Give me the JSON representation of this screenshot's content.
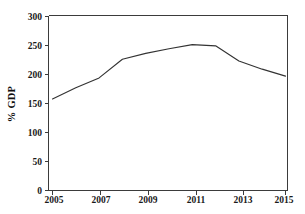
{
  "chart_data": {
    "type": "line",
    "title": "",
    "xlabel": "",
    "ylabel": "% GDP",
    "x": [
      2005,
      2006,
      2007,
      2008,
      2009,
      2010,
      2011,
      2012,
      2013,
      2014,
      2015
    ],
    "values": [
      157,
      176,
      193,
      225,
      235,
      243,
      250,
      248,
      222,
      208,
      196
    ],
    "series": [
      {
        "name": "% GDP",
        "values": [
          157,
          176,
          193,
          225,
          235,
          243,
          250,
          248,
          222,
          208,
          196
        ]
      }
    ],
    "xlim": [
      2005,
      2015
    ],
    "ylim": [
      0,
      300
    ],
    "x_tick_labels": [
      "2005",
      "2007",
      "2009",
      "2011",
      "2013",
      "2015"
    ],
    "x_tick_values": [
      2005,
      2007,
      2009,
      2011,
      2013,
      2015
    ],
    "y_tick_labels": [
      "0",
      "50",
      "100",
      "150",
      "200",
      "250",
      "300"
    ],
    "y_tick_values": [
      0,
      50,
      100,
      150,
      200,
      250,
      300
    ],
    "grid": false,
    "legend": false,
    "legend_position": "none",
    "line_color": "#333333",
    "background_color": "#ffffff",
    "axis_color": "#3b3b3b"
  }
}
